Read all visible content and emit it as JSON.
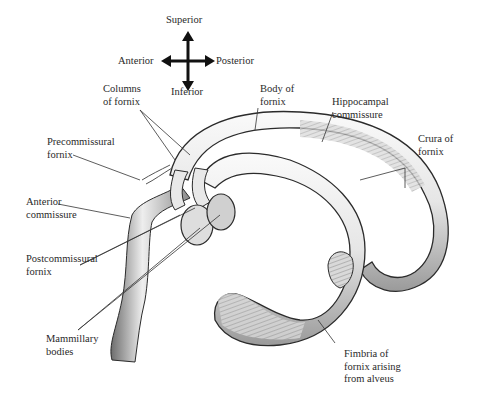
{
  "figure": {
    "orientation": {
      "superior": "Superior",
      "inferior": "Inferior",
      "anterior": "Anterior",
      "posterior": "Posterior"
    },
    "labels": {
      "columns_of_fornix": [
        "Columns",
        "of fornix"
      ],
      "body_of_fornix": [
        "Body of",
        "fornix"
      ],
      "hippocampal_commissure": [
        "Hippocampal",
        "commissure"
      ],
      "crura_of_fornix": [
        "Crura of",
        "fornix"
      ],
      "precommissural_fornix": [
        "Precommissural",
        "fornix"
      ],
      "anterior_commissure": [
        "Anterior",
        "commissure"
      ],
      "postcommissural_fornix": [
        "Postcommissural",
        "fornix"
      ],
      "mammillary_bodies": [
        "Mammillary",
        "bodies"
      ],
      "fimbria_of_fornix": [
        "Fimbria of",
        "fornix arising",
        "from alveus"
      ]
    },
    "colors": {
      "background": "#ffffff",
      "outline": "#2b2b2b",
      "fill_light": "#f2f2f2",
      "fill_shade": "#a8a8a8",
      "leader_line": "#333333"
    }
  }
}
